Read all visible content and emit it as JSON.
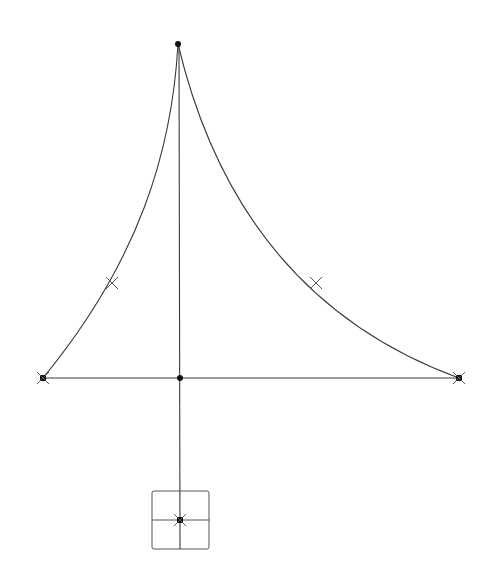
{
  "diagram": {
    "type": "structural-sketch",
    "background": "#ffffff",
    "line_color": "#3a3a3a",
    "node_color": "#111111",
    "nodes": [
      {
        "id": "top",
        "x": 178,
        "y": 44,
        "shape": "dot"
      },
      {
        "id": "left",
        "x": 43,
        "y": 378,
        "shape": "square-x"
      },
      {
        "id": "right",
        "x": 459,
        "y": 378,
        "shape": "square-x"
      },
      {
        "id": "center",
        "x": 180,
        "y": 378,
        "shape": "dot"
      },
      {
        "id": "box-center",
        "x": 180,
        "y": 520,
        "shape": "square-x"
      }
    ],
    "markers": [
      {
        "id": "left-curve-mid",
        "x": 112,
        "y": 283,
        "shape": "cross"
      },
      {
        "id": "right-curve-mid",
        "x": 316,
        "y": 283,
        "shape": "cross"
      }
    ],
    "edges": [
      {
        "from": "top",
        "to": "left",
        "kind": "curve"
      },
      {
        "from": "top",
        "to": "right",
        "kind": "curve"
      },
      {
        "from": "top",
        "to": "box-center",
        "kind": "line"
      },
      {
        "from": "left",
        "to": "right",
        "kind": "line"
      }
    ],
    "box": {
      "x": 152,
      "y": 491,
      "width": 57,
      "height": 58
    }
  }
}
